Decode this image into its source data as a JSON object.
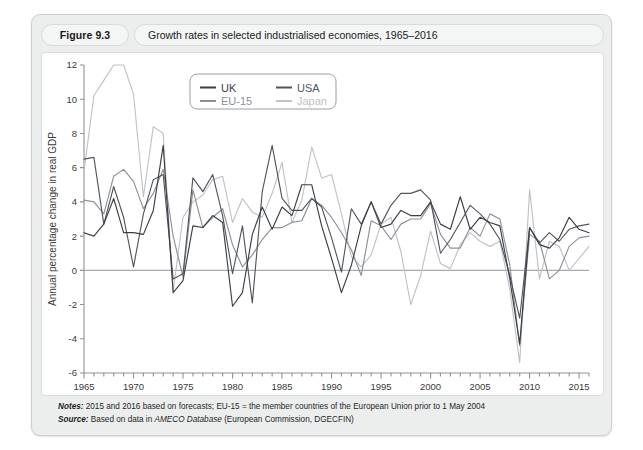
{
  "figure": {
    "number": "Figure 9.3",
    "caption": "Growth rates in selected industrialised economies, 1965–2016"
  },
  "notes": {
    "notes_label": "Notes:",
    "notes_text": " 2015 and 2016 based on forecasts; EU-15 = the member countries of the European Union prior to 1 May 2004",
    "source_label": "Source:",
    "source_text_a": " Based on data in ",
    "source_italic": "AMECO Database",
    "source_text_b": " (European Commission, DGECFIN)"
  },
  "colors": {
    "uk": "#3a3f45",
    "usa": "#52565c",
    "eu15": "#8d9196",
    "japan": "#bfc3c6",
    "axis": "#8e9296",
    "zero_line": "#a7abae",
    "plot_bg": "#ffffff",
    "frame_bg": "#eceeee"
  },
  "chart_data": {
    "type": "line",
    "title": "Growth rates in selected industrialised economies, 1965–2016",
    "xlabel": "",
    "ylabel": "Annual percentage change in real GDP",
    "xlim": [
      1965,
      2016
    ],
    "ylim": [
      -6,
      12
    ],
    "ytick_step": 2,
    "yticks": [
      -6,
      -4,
      -2,
      0,
      2,
      4,
      6,
      8,
      10,
      12
    ],
    "xticks_major": [
      1965,
      1970,
      1975,
      1980,
      1985,
      1990,
      1995,
      2000,
      2005,
      2010,
      2015
    ],
    "xtick_minor_step": 1,
    "grid": false,
    "zero_line": true,
    "legend_position": "top-center",
    "x": [
      1965,
      1966,
      1967,
      1968,
      1969,
      1970,
      1971,
      1972,
      1973,
      1974,
      1975,
      1976,
      1977,
      1978,
      1979,
      1980,
      1981,
      1982,
      1983,
      1984,
      1985,
      1986,
      1987,
      1988,
      1989,
      1990,
      1991,
      1992,
      1993,
      1994,
      1995,
      1996,
      1997,
      1998,
      1999,
      2000,
      2001,
      2002,
      2003,
      2004,
      2005,
      2006,
      2007,
      2008,
      2009,
      2010,
      2011,
      2012,
      2013,
      2014,
      2015,
      2016
    ],
    "series": [
      {
        "name": "UK",
        "color": "#3a3f45",
        "values": [
          2.2,
          2.0,
          2.7,
          4.2,
          2.2,
          2.2,
          2.1,
          3.5,
          7.3,
          -1.3,
          -0.6,
          2.6,
          2.5,
          3.2,
          2.8,
          -2.1,
          -1.3,
          2.1,
          3.7,
          2.4,
          3.7,
          3.2,
          5.0,
          5.0,
          2.6,
          0.7,
          -1.3,
          0.3,
          2.6,
          4.0,
          2.5,
          2.7,
          3.5,
          3.2,
          3.2,
          4.0,
          2.7,
          2.4,
          4.3,
          2.4,
          3.1,
          2.8,
          2.6,
          -0.5,
          -4.3,
          2.5,
          1.5,
          1.3,
          1.9,
          3.1,
          2.4,
          2.2
        ]
      },
      {
        "name": "USA",
        "color": "#52565c",
        "values": [
          6.5,
          6.6,
          2.7,
          4.9,
          3.1,
          0.2,
          3.3,
          5.3,
          5.6,
          -0.5,
          -0.2,
          5.4,
          4.6,
          5.6,
          3.2,
          -0.2,
          2.6,
          -1.9,
          4.6,
          7.3,
          4.2,
          3.5,
          3.5,
          4.2,
          3.7,
          1.9,
          -0.1,
          3.6,
          2.7,
          4.0,
          2.7,
          3.8,
          4.5,
          4.5,
          4.7,
          4.1,
          1.0,
          1.8,
          2.8,
          3.8,
          3.3,
          2.7,
          1.8,
          -0.3,
          -2.8,
          2.5,
          1.6,
          2.2,
          1.7,
          2.4,
          2.6,
          2.7
        ]
      },
      {
        "name": "EU-15",
        "color": "#8d9196",
        "values": [
          4.1,
          4.0,
          3.3,
          5.5,
          5.9,
          5.2,
          3.6,
          4.5,
          5.9,
          2.0,
          -0.4,
          4.7,
          2.5,
          3.1,
          3.6,
          1.5,
          0.2,
          0.9,
          1.8,
          2.5,
          2.5,
          2.8,
          2.9,
          4.2,
          3.8,
          3.1,
          2.2,
          1.2,
          -0.3,
          2.9,
          2.6,
          1.8,
          2.7,
          3.0,
          3.0,
          3.9,
          2.1,
          1.3,
          1.3,
          2.5,
          2.0,
          3.3,
          3.0,
          0.3,
          -4.4,
          2.1,
          1.7,
          -0.5,
          0.0,
          1.4,
          1.9,
          2.0
        ]
      },
      {
        "name": "Japan",
        "color": "#bfc3c6",
        "values": [
          5.8,
          10.2,
          11.1,
          12.0,
          12.0,
          10.3,
          4.3,
          8.4,
          8.0,
          -1.2,
          3.1,
          4.0,
          4.4,
          5.3,
          5.5,
          2.8,
          4.2,
          3.4,
          3.1,
          4.5,
          6.3,
          2.8,
          4.1,
          7.2,
          5.4,
          5.6,
          3.3,
          0.8,
          0.2,
          0.9,
          2.7,
          3.1,
          1.1,
          -2.0,
          -0.3,
          2.3,
          0.4,
          0.1,
          1.5,
          2.2,
          1.7,
          1.4,
          1.7,
          -1.1,
          -5.4,
          4.7,
          -0.5,
          1.7,
          1.4,
          0.0,
          0.7,
          1.4
        ]
      }
    ],
    "legend": [
      {
        "label": "UK",
        "color": "#3a3f45"
      },
      {
        "label": "USA",
        "color": "#52565c"
      },
      {
        "label": "EU-15",
        "color": "#8d9196"
      },
      {
        "label": "Japan",
        "color": "#bfc3c6"
      }
    ]
  }
}
